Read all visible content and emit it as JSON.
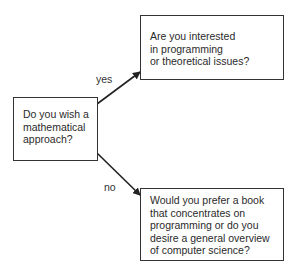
{
  "diagram": {
    "type": "decision-flowchart",
    "nodes": [
      {
        "id": "start",
        "text": "Do you wish a mathematical approach?",
        "lines": [
          "Do you wish a",
          "mathematical",
          "approach?"
        ]
      },
      {
        "id": "yes_branch",
        "text": "Are you interested in programming or theoretical issues?",
        "lines": [
          "Are you interested",
          "in programming",
          "or theoretical issues?"
        ]
      },
      {
        "id": "no_branch",
        "text": "Would you prefer a book that concentrates on programming or do you desire a general overview of computer science?",
        "lines": [
          "Would you prefer a book",
          "that concentrates on",
          "programming or do you",
          "desire a general overview",
          "of computer science?"
        ]
      }
    ],
    "edges": [
      {
        "from": "start",
        "to": "yes_branch",
        "label": "yes"
      },
      {
        "from": "start",
        "to": "no_branch",
        "label": "no"
      }
    ]
  }
}
